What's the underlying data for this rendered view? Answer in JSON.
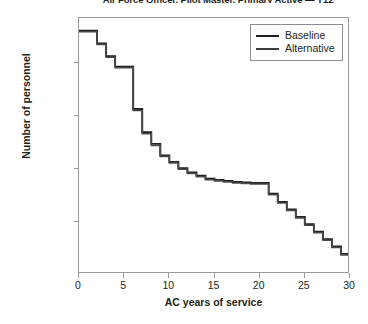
{
  "chart_data": {
    "type": "line",
    "subtype": "step-post",
    "title": "Air Force Officer, Pilot Master, Primary Active — Y12",
    "xlabel": "AC years of service",
    "ylabel": "Number of personnel",
    "xlim": [
      0,
      30
    ],
    "ylim": [
      0,
      2420
    ],
    "xticks": [
      0,
      5,
      10,
      15,
      20,
      25,
      30
    ],
    "xtick_labels": [
      "0",
      "5",
      "10",
      "15",
      "20",
      "25",
      "30"
    ],
    "yticks": [
      500,
      1000,
      1500,
      2000
    ],
    "ytick_labels": [
      "500",
      "1,000",
      "1,500",
      "2,000"
    ],
    "grid": false,
    "legend_position": "top-right",
    "legend_entries": [
      "Baseline",
      "Alternative"
    ],
    "x": [
      0,
      1,
      2,
      3,
      4,
      5,
      6,
      7,
      8,
      9,
      10,
      11,
      12,
      13,
      14,
      15,
      16,
      17,
      18,
      19,
      20,
      21,
      22,
      23,
      24,
      25,
      26,
      27,
      28,
      29,
      30
    ],
    "series": [
      {
        "name": "Baseline",
        "color": "#231f20",
        "values": [
          2300,
          2300,
          2180,
          2060,
          1960,
          1960,
          1560,
          1340,
          1230,
          1120,
          1060,
          1000,
          960,
          930,
          900,
          890,
          880,
          870,
          865,
          860,
          860,
          760,
          680,
          610,
          540,
          470,
          400,
          330,
          260,
          190,
          130
        ]
      },
      {
        "name": "Alternative",
        "color": "#4a4a4a",
        "values": [
          2290,
          2290,
          2170,
          2050,
          1950,
          1950,
          1545,
          1325,
          1215,
          1110,
          1050,
          990,
          950,
          920,
          890,
          880,
          870,
          860,
          855,
          850,
          850,
          750,
          670,
          600,
          530,
          460,
          390,
          320,
          250,
          180,
          120
        ]
      }
    ]
  }
}
